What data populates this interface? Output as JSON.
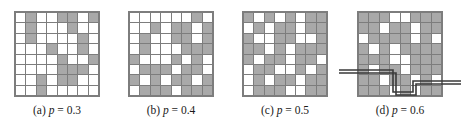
{
  "figure": {
    "grid_size": 8,
    "colors": {
      "filled_cell": "#a9a9a9",
      "empty_cell": "#ffffff",
      "grid_line": "#7d7d7d",
      "path_line": "#3a3a3a",
      "background": "#ffffff",
      "caption_text": "#1a1a1a"
    }
  },
  "panels": [
    {
      "id": "panel-a",
      "caption_label": "(a)",
      "caption_symbol": "p",
      "caption_equals": "=",
      "caption_value": "0.3",
      "caption_full": "(a) p = 0.3",
      "p": 0.3,
      "has_path": false,
      "grid": [
        [
          0,
          1,
          0,
          0,
          1,
          1,
          0,
          1
        ],
        [
          0,
          1,
          0,
          0,
          0,
          1,
          0,
          0
        ],
        [
          0,
          1,
          0,
          0,
          0,
          0,
          1,
          0
        ],
        [
          0,
          0,
          0,
          1,
          0,
          0,
          1,
          0
        ],
        [
          0,
          0,
          0,
          0,
          1,
          0,
          0,
          1
        ],
        [
          0,
          0,
          0,
          0,
          1,
          1,
          1,
          0
        ],
        [
          0,
          0,
          1,
          0,
          1,
          1,
          0,
          0
        ],
        [
          0,
          0,
          1,
          0,
          0,
          0,
          0,
          0
        ]
      ]
    },
    {
      "id": "panel-b",
      "caption_label": "(b)",
      "caption_symbol": "p",
      "caption_equals": "=",
      "caption_value": "0.4",
      "caption_full": "(b) p = 0.4",
      "p": 0.4,
      "has_path": false,
      "grid": [
        [
          0,
          0,
          0,
          0,
          0,
          0,
          1,
          0
        ],
        [
          0,
          0,
          1,
          0,
          1,
          1,
          0,
          1
        ],
        [
          0,
          1,
          0,
          0,
          1,
          1,
          0,
          1
        ],
        [
          0,
          1,
          0,
          0,
          0,
          1,
          1,
          1
        ],
        [
          1,
          0,
          0,
          0,
          1,
          0,
          1,
          0
        ],
        [
          0,
          1,
          1,
          1,
          0,
          1,
          1,
          0
        ],
        [
          1,
          0,
          1,
          0,
          1,
          1,
          0,
          1
        ],
        [
          0,
          1,
          1,
          1,
          0,
          1,
          1,
          1
        ]
      ]
    },
    {
      "id": "panel-c",
      "caption_label": "(c)",
      "caption_symbol": "p",
      "caption_equals": "=",
      "caption_value": "0.5",
      "caption_full": "(c) p = 0.5",
      "p": 0.5,
      "has_path": false,
      "grid": [
        [
          1,
          0,
          1,
          0,
          1,
          0,
          1,
          1
        ],
        [
          0,
          1,
          0,
          1,
          1,
          0,
          1,
          1
        ],
        [
          1,
          0,
          0,
          1,
          1,
          0,
          0,
          1
        ],
        [
          1,
          1,
          0,
          1,
          0,
          1,
          1,
          1
        ],
        [
          1,
          0,
          1,
          1,
          0,
          1,
          1,
          0
        ],
        [
          0,
          1,
          1,
          0,
          0,
          1,
          0,
          1
        ],
        [
          0,
          1,
          0,
          1,
          1,
          0,
          1,
          1
        ],
        [
          0,
          1,
          1,
          1,
          0,
          0,
          1,
          1
        ]
      ]
    },
    {
      "id": "panel-d",
      "caption_label": "(d)",
      "caption_symbol": "p",
      "caption_equals": "=",
      "caption_value": "0.6",
      "caption_full": "(d) p = 0.6",
      "p": 0.6,
      "has_path": true,
      "path_description": "spanning-cluster crossing path entering from the left edge and exiting at the right edge",
      "grid": [
        [
          1,
          1,
          1,
          0,
          0,
          1,
          1,
          1
        ],
        [
          1,
          1,
          0,
          1,
          1,
          0,
          1,
          1
        ],
        [
          0,
          1,
          1,
          1,
          1,
          0,
          1,
          0
        ],
        [
          1,
          0,
          1,
          0,
          1,
          1,
          1,
          1
        ],
        [
          1,
          1,
          1,
          0,
          0,
          1,
          1,
          1
        ],
        [
          1,
          0,
          1,
          1,
          0,
          1,
          1,
          1
        ],
        [
          1,
          1,
          0,
          1,
          1,
          0,
          1,
          0
        ],
        [
          1,
          1,
          1,
          0,
          1,
          0,
          1,
          1
        ]
      ]
    }
  ]
}
